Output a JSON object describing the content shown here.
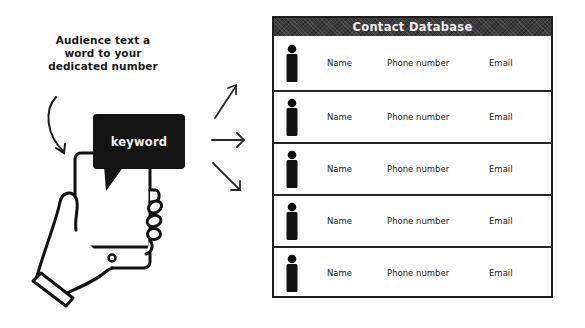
{
  "diagram": {
    "caption_lines": [
      "Audience text a",
      "word to your",
      "dedicated number"
    ],
    "speech_bubble": {
      "text": "keyword"
    },
    "arrows": [
      "up-right",
      "right",
      "down-right"
    ],
    "table": {
      "title": "Contact Database",
      "rows": [
        {
          "name": "Name",
          "phone": "Phone number",
          "email": "Email"
        },
        {
          "name": "Name",
          "phone": "Phone number",
          "email": "Email"
        },
        {
          "name": "Name",
          "phone": "Phone number",
          "email": "Email"
        },
        {
          "name": "Name",
          "phone": "Phone number",
          "email": "Email"
        },
        {
          "name": "Name",
          "phone": "Phone number",
          "email": "Email"
        }
      ]
    },
    "colors": {
      "ink": "#111111",
      "header_bg": "#3c3c3c",
      "header_text": "#ececec",
      "background": "#ffffff"
    }
  }
}
